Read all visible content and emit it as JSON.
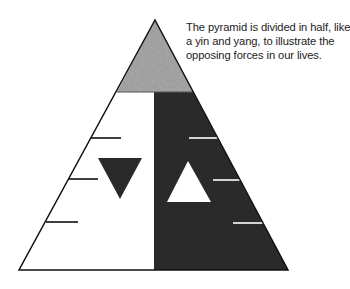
{
  "caption": {
    "lines": [
      "The pyramid is divided in half, like",
      "a yin and yang, to illustrate the",
      "opposing forces in our lives."
    ]
  },
  "colors": {
    "apex_fill": "#a8a8a8",
    "dark_half": "#2a2a2a",
    "light_half": "#ffffff",
    "outline": "#111111",
    "text": "#222222"
  },
  "pyramid": {
    "apex": [
      155,
      20
    ],
    "base_left": [
      19,
      270
    ],
    "base_right": [
      288,
      270
    ],
    "apex_band_bottom_y": 92,
    "divider_x": 154,
    "left_ticks": [
      {
        "y": 138,
        "x1": 91,
        "x2": 121
      },
      {
        "y": 179,
        "x1": 69,
        "x2": 98
      },
      {
        "y": 222,
        "x1": 46,
        "x2": 78
      }
    ],
    "right_ticks": [
      {
        "y": 138,
        "x1": 189,
        "x2": 219
      },
      {
        "y": 180,
        "x1": 213,
        "x2": 240
      },
      {
        "y": 223,
        "x1": 233,
        "x2": 264
      }
    ],
    "down_triangle": {
      "points": "98,158 142,158 120,199"
    },
    "up_triangle": {
      "points": "188,161 211,202 167,202"
    }
  }
}
